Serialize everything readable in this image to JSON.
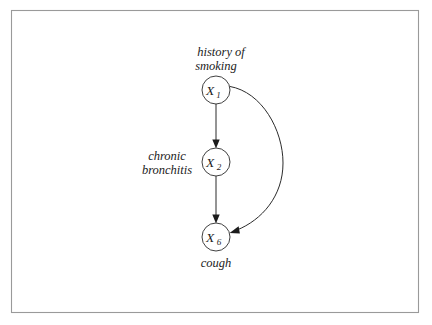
{
  "figure": {
    "kind": "causal-dag",
    "background_color": "#ffffff",
    "border_color": "#9a9a9a",
    "ink_color": "#1c1c1c",
    "frame": {
      "x": 11,
      "y": 10,
      "width": 408,
      "height": 303
    }
  },
  "nodes": [
    {
      "id": "X1",
      "symbol": "X",
      "subscript": "1",
      "cx": 216,
      "cy": 90,
      "r": 14,
      "annotation": "history of\nsmoking",
      "annotation_line1": "history of",
      "annotation_line2": "smoking",
      "annotation_position": "above"
    },
    {
      "id": "X2",
      "symbol": "X",
      "subscript": "2",
      "cx": 216,
      "cy": 162,
      "r": 14,
      "annotation": "chronic\nbronchitis",
      "annotation_line1": "chronic",
      "annotation_line2": "bronchitis",
      "annotation_position": "left"
    },
    {
      "id": "X6",
      "symbol": "X",
      "subscript": "6",
      "cx": 216,
      "cy": 237,
      "r": 14,
      "annotation": "cough",
      "annotation_line1": "cough",
      "annotation_line2": "",
      "annotation_position": "below"
    }
  ],
  "edges": [
    {
      "id": "e1",
      "from": "X1",
      "to": "X2",
      "shape": "straight",
      "directed": true
    },
    {
      "id": "e2",
      "from": "X2",
      "to": "X6",
      "shape": "straight",
      "directed": true
    },
    {
      "id": "e3",
      "from": "X1",
      "to": "X6",
      "shape": "curved",
      "directed": true,
      "bulge_side": "right"
    }
  ],
  "labels": {
    "x1_symbol": "X",
    "x1_subscript": "1",
    "x2_symbol": "X",
    "x2_subscript": "2",
    "x6_symbol": "X",
    "x6_subscript": "6",
    "history_of": "history of",
    "smoking": "smoking",
    "chronic": "chronic",
    "bronchitis": "bronchitis",
    "cough": "cough"
  }
}
